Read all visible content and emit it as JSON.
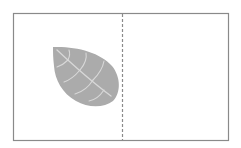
{
  "diagram": {
    "type": "symmetry-exercise",
    "frame": {
      "x": 13,
      "y": 13,
      "width": 215,
      "height": 127,
      "stroke": "#8a8a8a"
    },
    "symmetry_line": {
      "x": 122,
      "style": "dashed",
      "stroke": "#8a8a8a"
    },
    "shapes": [
      {
        "name": "leaf",
        "icon": "leaf-icon",
        "fill": "#ababab",
        "vein_color": "#d8d8d8",
        "side": "left"
      }
    ],
    "right_panel": "empty"
  },
  "colors": {
    "background": "#ffffff",
    "frame": "#8a8a8a",
    "leaf": "#ababab",
    "veins": "#d8d8d8"
  }
}
